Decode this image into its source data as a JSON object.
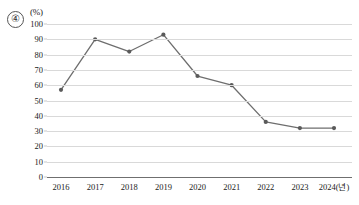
{
  "item_marker": "④",
  "unit_label": "(%)",
  "chart_data": {
    "type": "line",
    "title": "",
    "subtitle": "",
    "xlabel": "",
    "ylabel": "(%)",
    "categories": [
      "2016",
      "2017",
      "2018",
      "2019",
      "2020",
      "2021",
      "2022",
      "2023",
      "2024(년)"
    ],
    "x_tick_labels": [
      "2016",
      "2017",
      "2018",
      "2019",
      "2020",
      "2021",
      "2022",
      "2023",
      "2024(년)"
    ],
    "values": [
      57,
      90,
      82,
      93,
      66,
      60,
      36,
      32,
      32
    ],
    "series": [
      {
        "name": "",
        "values": [
          57,
          90,
          82,
          93,
          66,
          60,
          36,
          32,
          32
        ]
      }
    ],
    "ylim": [
      0,
      100
    ],
    "y_ticks": [
      0,
      10,
      20,
      30,
      40,
      50,
      60,
      70,
      80,
      90,
      100
    ],
    "y_tick_labels": [
      "0",
      "10",
      "20",
      "30",
      "40",
      "50",
      "60",
      "70",
      "80",
      "90",
      "100"
    ],
    "grid": true,
    "legend": false,
    "legend_position": "none",
    "line_color": "#6e6e6e",
    "marker_color": "#5a5a5a",
    "marker": "circle",
    "gridline_color": "#d9d9d9",
    "axis_color": "#6f6f6f"
  }
}
